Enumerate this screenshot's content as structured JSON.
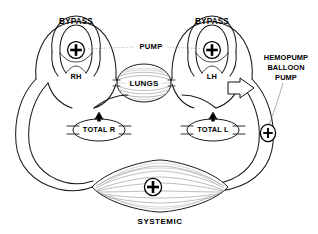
{
  "diagram": {
    "background_color": "#ffffff",
    "line_color": "#1a1a1a",
    "labels": {
      "bypass_left": "BYPASS",
      "bypass_right": "BYPASS",
      "pump": "PUMP",
      "right_heart": "RH",
      "left_heart": "LH",
      "lungs": "LUNGS",
      "total_right": "TOTAL R",
      "total_left": "TOTAL L",
      "systemic": "SYSTEMIC",
      "hemopump_line1": "HEMOPUMP",
      "hemopump_line2": "BALLOON",
      "hemopump_line3": "PUMP"
    },
    "icons": {
      "pump_symbol": "plus-circle",
      "valve_symbol": "filled-arrowhead",
      "device_symbol": "block-arrow"
    }
  }
}
